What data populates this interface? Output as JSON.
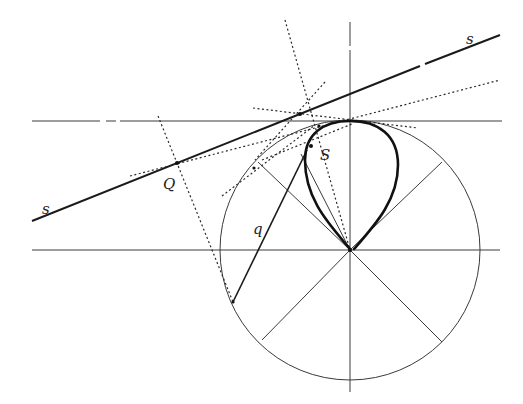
{
  "diagram": {
    "labels": {
      "line_s_right": "s",
      "line_s_left": "s",
      "point_Q": "Q",
      "point_S": "S",
      "segment_q": "q"
    },
    "colors": {
      "ink": "#1a1a1a",
      "background": "#ffffff"
    },
    "circle": {
      "cx": 350,
      "cy": 250,
      "r": 130
    },
    "points": {
      "Q": [
        177,
        163
      ],
      "S": [
        311,
        146
      ],
      "center": [
        350,
        250
      ],
      "top": [
        350,
        121
      ],
      "foot_q": [
        233,
        302
      ]
    }
  }
}
